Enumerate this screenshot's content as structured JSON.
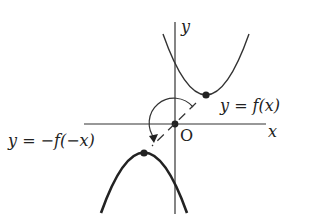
{
  "diagram": {
    "type": "function-graph-symmetry",
    "axes": {
      "x_label": "x",
      "y_label": "y",
      "origin_label": "O"
    },
    "curves": [
      {
        "label": "y = f(x)",
        "shape": "upward parabola",
        "vertex_position": "upper right of origin"
      },
      {
        "label": "y = −f(−x)",
        "shape": "downward parabola",
        "vertex_position": "lower left of origin"
      }
    ],
    "annotation": "180° rotation about origin (point symmetry)",
    "colors": {
      "stroke": "#333333",
      "background": "#ffffff"
    }
  }
}
